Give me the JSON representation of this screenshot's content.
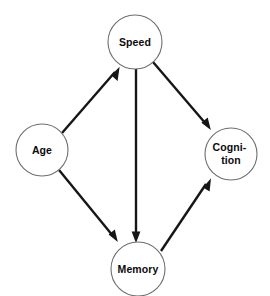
{
  "diagram": {
    "background_color": "#ffffff",
    "node_stroke_color": "#6e6e6e",
    "node_fill_color": "#ffffff",
    "edge_color": "#161616",
    "label_color": "#0b0b0b",
    "nodes": [
      {
        "id": "speed",
        "label": "Speed",
        "lines": [
          "Speed"
        ],
        "cx": 135,
        "cy": 42,
        "r": 27
      },
      {
        "id": "age",
        "label": "Age",
        "lines": [
          "Age"
        ],
        "cx": 42,
        "cy": 150,
        "r": 26
      },
      {
        "id": "cognition",
        "label": "Cognition",
        "lines": [
          "Cogni-",
          "tion"
        ],
        "cx": 231,
        "cy": 154,
        "r": 26
      },
      {
        "id": "memory",
        "label": "Memory",
        "lines": [
          "Memory"
        ],
        "cx": 138,
        "cy": 269,
        "r": 27
      }
    ],
    "edges": [
      {
        "id": "age-to-speed",
        "from": "Age",
        "to": "Speed",
        "directed": true
      },
      {
        "id": "age-to-memory",
        "from": "Age",
        "to": "Memory",
        "directed": true
      },
      {
        "id": "speed-to-cognition",
        "from": "Speed",
        "to": "Cognition",
        "directed": true
      },
      {
        "id": "speed-to-memory",
        "from": "Speed",
        "to": "Memory",
        "directed": true
      },
      {
        "id": "memory-to-cognition",
        "from": "Memory",
        "to": "Cognition",
        "directed": true
      }
    ]
  }
}
